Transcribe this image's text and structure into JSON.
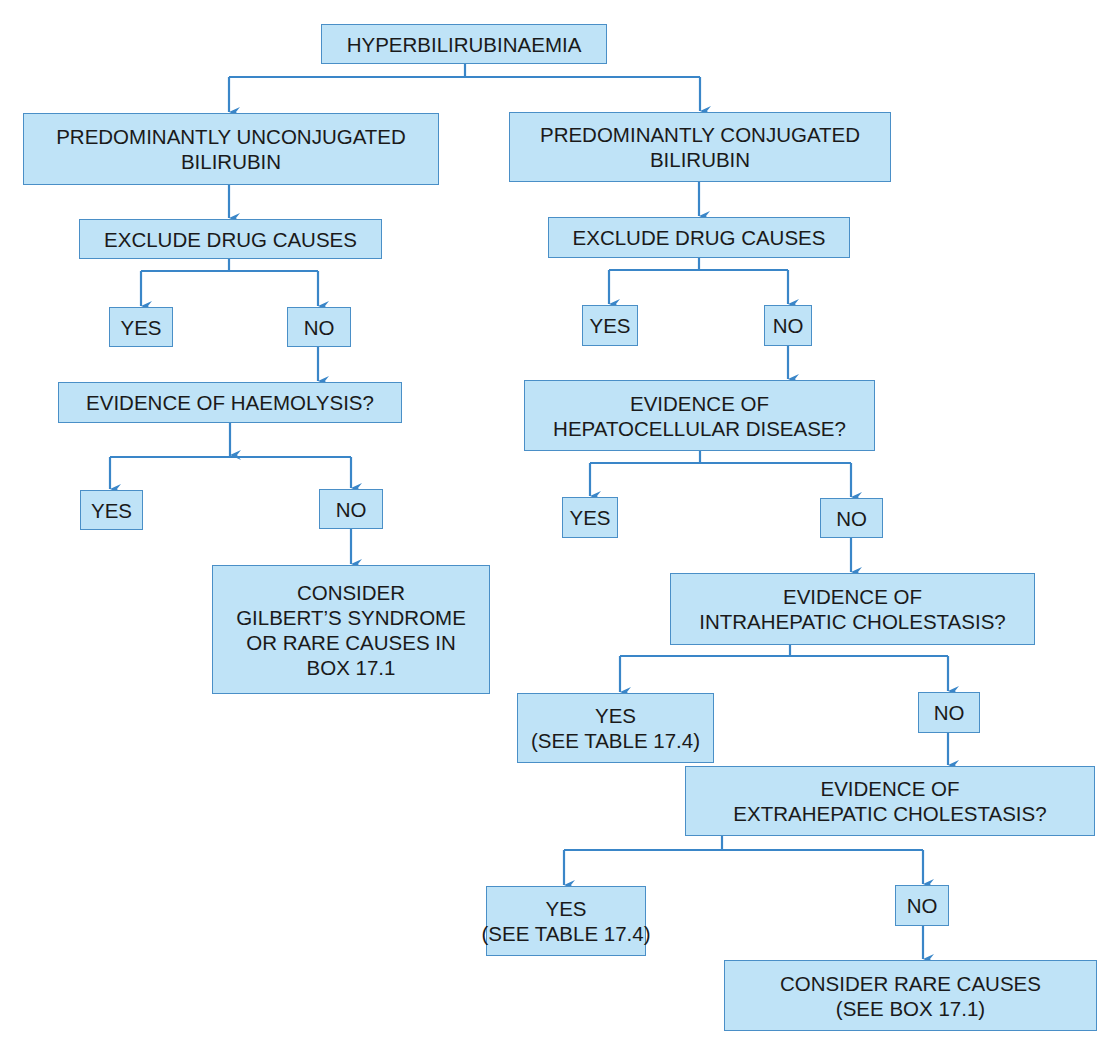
{
  "diagram": {
    "type": "flowchart",
    "line_color": "#3a86c8",
    "box_fill": "#bfe3f7",
    "box_border": "#4a8fc7",
    "text_color": "#1a1a1a",
    "nodes": {
      "root": [
        "HYPERBILIRUBINAEMIA"
      ],
      "unconjugated": [
        "PREDOMINANTLY UNCONJUGATED",
        "BILIRUBIN"
      ],
      "conjugated": [
        "PREDOMINANTLY CONJUGATED",
        "BILIRUBIN"
      ],
      "left_exclude_drug": [
        "EXCLUDE DRUG CAUSES"
      ],
      "left_drug_yes": [
        "YES"
      ],
      "left_drug_no": [
        "NO"
      ],
      "haemolysis": [
        "EVIDENCE OF HAEMOLYSIS?"
      ],
      "haemolysis_yes": [
        "YES"
      ],
      "haemolysis_no": [
        "NO"
      ],
      "gilbert": [
        "CONSIDER",
        "GILBERT’S SYNDROME",
        "OR RARE CAUSES IN",
        "BOX 17.1"
      ],
      "right_exclude_drug": [
        "EXCLUDE DRUG CAUSES"
      ],
      "right_drug_yes": [
        "YES"
      ],
      "right_drug_no": [
        "NO"
      ],
      "hepatocellular": [
        "EVIDENCE OF",
        "HEPATOCELLULAR DISEASE?"
      ],
      "hepatocellular_yes": [
        "YES"
      ],
      "hepatocellular_no": [
        "NO"
      ],
      "intrahepatic": [
        "EVIDENCE OF",
        "INTRAHEPATIC CHOLESTASIS?"
      ],
      "intrahepatic_yes": [
        "YES",
        "(SEE TABLE 17.4)"
      ],
      "intrahepatic_no": [
        "NO"
      ],
      "extrahepatic": [
        "EVIDENCE OF",
        "EXTRAHEPATIC CHOLESTASIS?"
      ],
      "extrahepatic_yes": [
        "YES",
        "(SEE TABLE 17.4)"
      ],
      "extrahepatic_no": [
        "NO"
      ],
      "rare_causes": [
        "CONSIDER RARE CAUSES",
        "(SEE BOX 17.1)"
      ]
    },
    "edges": [
      [
        "root",
        "unconjugated"
      ],
      [
        "root",
        "conjugated"
      ],
      [
        "unconjugated",
        "left_exclude_drug"
      ],
      [
        "left_exclude_drug",
        "left_drug_yes"
      ],
      [
        "left_exclude_drug",
        "left_drug_no"
      ],
      [
        "left_drug_no",
        "haemolysis"
      ],
      [
        "haemolysis",
        "haemolysis_yes"
      ],
      [
        "haemolysis",
        "haemolysis_no"
      ],
      [
        "haemolysis_no",
        "gilbert"
      ],
      [
        "conjugated",
        "right_exclude_drug"
      ],
      [
        "right_exclude_drug",
        "right_drug_yes"
      ],
      [
        "right_exclude_drug",
        "right_drug_no"
      ],
      [
        "right_drug_no",
        "hepatocellular"
      ],
      [
        "hepatocellular",
        "hepatocellular_yes"
      ],
      [
        "hepatocellular",
        "hepatocellular_no"
      ],
      [
        "hepatocellular_no",
        "intrahepatic"
      ],
      [
        "intrahepatic",
        "intrahepatic_yes"
      ],
      [
        "intrahepatic",
        "intrahepatic_no"
      ],
      [
        "intrahepatic_no",
        "extrahepatic"
      ],
      [
        "extrahepatic",
        "extrahepatic_yes"
      ],
      [
        "extrahepatic",
        "extrahepatic_no"
      ],
      [
        "extrahepatic_no",
        "rare_causes"
      ]
    ]
  }
}
